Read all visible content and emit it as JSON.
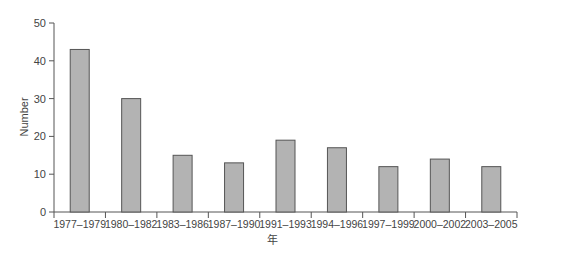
{
  "chart_data": {
    "type": "bar",
    "title": "",
    "xlabel": "年",
    "ylabel": "Number",
    "ylim": [
      0,
      50
    ],
    "yticks": [
      0,
      10,
      20,
      30,
      40,
      50
    ],
    "grid": false,
    "legend": null,
    "categories": [
      "1977–1979",
      "1980–1982",
      "1983–1986",
      "1987–1990",
      "1991–1993",
      "1994–1996",
      "1997–1999",
      "2000–2002",
      "2003–2005"
    ],
    "values": [
      43,
      30,
      15,
      13,
      19,
      17,
      12,
      14,
      12
    ],
    "bar_color": "#b3b3b3",
    "bar_edge_color": "#555555"
  }
}
